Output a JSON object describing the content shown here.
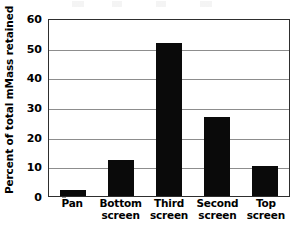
{
  "chart_data": {
    "type": "bar",
    "title": "",
    "subtitle": "",
    "xlabel": "",
    "ylabel": "Percent of total mMass retained",
    "categories": [
      "Pan",
      "Bottom screen",
      "Third screen",
      "Second screen",
      "Top screen"
    ],
    "category_lines": [
      [
        "Pan",
        ""
      ],
      [
        "Bottom",
        "screen"
      ],
      [
        "Third",
        "screen"
      ],
      [
        "Second",
        "screen"
      ],
      [
        "Top",
        "screen"
      ]
    ],
    "values": [
      2,
      12,
      51.5,
      26.5,
      10
    ],
    "ylim": [
      0,
      60
    ],
    "ytick_values": [
      0,
      10,
      20,
      30,
      40,
      50,
      60
    ],
    "ytick_labels": [
      "0",
      "10",
      "20",
      "30",
      "40",
      "50",
      "60"
    ],
    "grid": true,
    "grid_axis": "y",
    "legend": false,
    "legend_position": "none",
    "bar_color": "#0a0a0a",
    "gridline_color": "#8d8d8d",
    "axis_color": "#2e2e2e",
    "background_color": "#ffffff"
  },
  "axis": {
    "y_title": "Percent of total mMass retained"
  }
}
